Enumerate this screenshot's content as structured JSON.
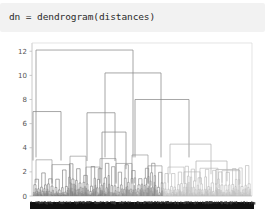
{
  "notebook": {
    "code_cell": {
      "source": "dn = dendrogram(distances)",
      "background_color": "#f2f2f2",
      "text_color": "#2b2b2b"
    }
  },
  "chart_data": {
    "type": "dendrogram",
    "title": "",
    "xlabel": "",
    "ylabel": "",
    "ylim": [
      0,
      12.6
    ],
    "y_ticks": [
      0,
      2,
      4,
      6,
      8,
      10,
      12
    ],
    "y_tick_labels": [
      "0",
      "2",
      "4",
      "6",
      "8",
      "10",
      "12"
    ],
    "grid": false,
    "legend": false,
    "n_leaves": 180,
    "leaf_labels_visible": true,
    "leaf_labels_unreadable": true,
    "link_color": "#8a8a8a",
    "link_color_light": "#b4b4b4",
    "axis_color": "#bdbdbd",
    "tick_text_color": "#555555",
    "plot_box": {
      "left": 32,
      "right": 252,
      "top": 8,
      "bottom": 160
    },
    "major_merges": [
      {
        "name": "root",
        "height": 12.1,
        "x_left": 36,
        "x_right": 133
      },
      {
        "name": "right-subtree",
        "height": 10.2,
        "x_left": 105,
        "x_right": 161
      },
      {
        "name": "mid-right",
        "height": 8.0,
        "x_left": 135,
        "x_right": 189
      },
      {
        "name": "left-cluster",
        "height": 7.0,
        "x_left": 33,
        "x_right": 61
      },
      {
        "name": "mid-left",
        "height": 6.9,
        "x_left": 87,
        "x_right": 115
      },
      {
        "name": "inner-right",
        "height": 5.3,
        "x_left": 102,
        "x_right": 126
      },
      {
        "name": "far-right",
        "height": 4.3,
        "x_left": 170,
        "x_right": 211
      },
      {
        "name": "far-right-sub",
        "height": 2.9,
        "x_left": 196,
        "x_right": 227
      },
      {
        "name": "tail-right",
        "height": 2.2,
        "x_left": 216,
        "x_right": 239
      }
    ],
    "density_note": "hundreds of low-height merges form a near-solid band below h=2.5; leaf label row renders as a solid black strip"
  }
}
